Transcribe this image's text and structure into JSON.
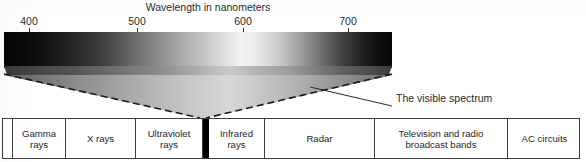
{
  "figure": {
    "title": "Wavelength in nanometers",
    "callout": "The visible spectrum"
  },
  "axis": {
    "unit": "nanometers",
    "ticks": [
      {
        "label": "400",
        "x": 29
      },
      {
        "label": "500",
        "x": 137
      },
      {
        "label": "600",
        "x": 243
      },
      {
        "label": "700",
        "x": 348
      }
    ]
  },
  "spectrum": {
    "left_px": 4,
    "right_px": 392,
    "rendering": "grayscale-gradient",
    "peak_brightness_x": 235
  },
  "bands": [
    {
      "name": "spacer-left",
      "label": "",
      "width": 10,
      "type": "spacer"
    },
    {
      "name": "gamma-rays",
      "label": "Gamma\nrays",
      "width": 53,
      "type": "band"
    },
    {
      "name": "x-rays",
      "label": "X rays",
      "width": 70,
      "type": "band"
    },
    {
      "name": "ultraviolet-rays",
      "label": "Ultraviolet\nrays",
      "width": 67,
      "type": "band"
    },
    {
      "name": "visible-spectrum-divider",
      "label": "",
      "width": 6,
      "type": "visible"
    },
    {
      "name": "infrared-rays",
      "label": "Infrared\nrays",
      "width": 56,
      "type": "band"
    },
    {
      "name": "radar",
      "label": "Radar",
      "width": 110,
      "type": "band"
    },
    {
      "name": "television-and-radio",
      "label": "Television and radio\nbroadcast bands",
      "width": 133,
      "type": "band"
    },
    {
      "name": "ac-circuits",
      "label": "AC circuits",
      "width": 73,
      "type": "band"
    }
  ],
  "colors": {
    "paper": "#ffffff",
    "ink": "#1f1f1f",
    "rule": "#3f3f3f",
    "visible_divider": "#000000"
  }
}
